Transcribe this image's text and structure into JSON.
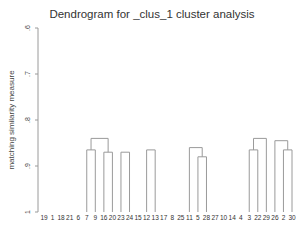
{
  "chart_data": {
    "type": "dendrogram",
    "title": "Dendrogram for _clus_1 cluster analysis",
    "xlabel": "",
    "ylabel": "matching similarity measure",
    "y_ticks": [
      ".6",
      ".7",
      ".8",
      ".9",
      "1"
    ],
    "y_range": [
      0.6,
      1.0
    ],
    "y_direction": "1 at bottom, .6 at top",
    "leaves": [
      "19",
      "1",
      "18",
      "21",
      "6",
      "7",
      "9",
      "16",
      "20",
      "23",
      "24",
      "15",
      "12",
      "13",
      "17",
      "8",
      "25",
      "11",
      "5",
      "28",
      "27",
      "10",
      "14",
      "4",
      "3",
      "22",
      "29",
      "26",
      "2",
      "30"
    ],
    "merges": [
      {
        "children": [
          "7",
          "9"
        ],
        "height": 0.865
      },
      {
        "children": [
          "16",
          "20"
        ],
        "height": 0.87
      },
      {
        "children": [
          "[7,9]",
          "[16,20]"
        ],
        "height": 0.84
      },
      {
        "children": [
          "23",
          "24"
        ],
        "height": 0.87
      },
      {
        "children": [
          "6",
          "[7,9,16,20]"
        ],
        "height": 0.835
      },
      {
        "children": [
          "21",
          "[6..20]"
        ],
        "height": 0.815
      },
      {
        "children": [
          "18",
          "[21..20]"
        ],
        "height": 0.79
      },
      {
        "children": [
          "1",
          "[18..20]"
        ],
        "height": 0.78
      },
      {
        "children": [
          "19",
          "[1..20]"
        ],
        "height": 0.795
      },
      {
        "children": [
          "12",
          "13"
        ],
        "height": 0.865
      },
      {
        "children": [
          "5",
          "28"
        ],
        "height": 0.88
      },
      {
        "children": [
          "11",
          "[5,28]"
        ],
        "height": 0.86
      },
      {
        "children": [
          "25",
          "[11,5,28]"
        ],
        "height": 0.845
      },
      {
        "children": [
          "8",
          "[25..28]"
        ],
        "height": 0.82
      },
      {
        "children": [
          "17",
          "[8..28]"
        ],
        "height": 0.81
      },
      {
        "children": [
          "[12,13]",
          "[17..28]"
        ],
        "height": 0.795
      },
      {
        "children": [
          "15",
          "[12..28]"
        ],
        "height": 0.785
      },
      {
        "children": [
          "24",
          "[15..28]"
        ],
        "height": 0.775
      },
      {
        "children": [
          "3",
          "22"
        ],
        "height": 0.865
      },
      {
        "children": [
          "2",
          "30"
        ],
        "height": 0.865
      },
      {
        "children": [
          "[3,22]",
          "29"
        ],
        "height": 0.84
      },
      {
        "children": [
          "26",
          "[2,30]"
        ],
        "height": 0.845
      },
      {
        "children": [
          "4",
          "[3,22,29]"
        ],
        "height": 0.82
      },
      {
        "children": [
          "14",
          "[4..29]"
        ],
        "height": 0.805
      },
      {
        "children": [
          "10",
          "[14..29]"
        ],
        "height": 0.795
      },
      {
        "children": [
          "[10..29]",
          "[26,2,30]"
        ],
        "height": 0.8
      },
      {
        "children": [
          "27",
          "[10..30]"
        ],
        "height": 0.775
      },
      {
        "children": [
          "[24..28]",
          "[27..30]"
        ],
        "height": 0.705
      },
      {
        "children": [
          "[19..20]",
          "[24..30]"
        ],
        "height": 0.68
      }
    ],
    "note": "Leaf order in the middle runs and all merge heights are approximate readings; see accompanying description"
  }
}
